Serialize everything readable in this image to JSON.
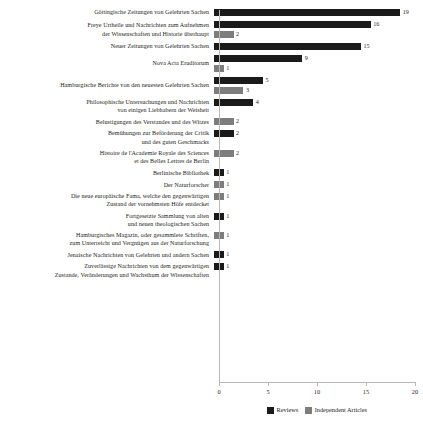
{
  "chart_data": {
    "type": "bar",
    "orientation": "horizontal",
    "title": "",
    "xlabel": "",
    "ylabel": "",
    "xlim": [
      0,
      20
    ],
    "xticks": [
      0,
      5,
      10,
      15,
      20
    ],
    "xticklabels": [
      "0",
      "5",
      "10",
      "15",
      "20"
    ],
    "grid": false,
    "legend_position": "bottom",
    "colors": {
      "reviews": "#1a1a1a",
      "independent": "#7d7d7d",
      "axis": "#b9b9b9",
      "text": "#1d1d1d",
      "background": "#ffffff"
    },
    "series": [
      {
        "name": "Reviews",
        "key": "reviews"
      },
      {
        "name": "Independent Articles",
        "key": "independent"
      }
    ],
    "categories": [
      "Göttingische Zeitungen von Gelehrten Sachen",
      "Freye Urtheile und Nachrichten zum Aufnehmen der Wissenschaften und Historie überhaupt",
      "Neuer Zeitungen von Gelehrten Sachen",
      "Nova Acta Eruditorum",
      "Hamburgische Berichte von den neuesten Gelehrten Sachen",
      "Philosophische Untersuchungen und Nachrichten von einigen Liebhabern der Weisheit",
      "Belustigungen des Verstandes und des Witzes",
      "Bemühungen zur Beförderung der Critik und des guten Geschmacks",
      "Histoire de l'Academie Royale des Sciences et des Belles Lettres de Berlin",
      "Berlinische Bibliothek",
      "Der Naturforscher",
      "Die neue europäische Fama, welche den gegenwärtigen Zustand der vornehmsten Höfe entdecket",
      "Fortgesetzte Sammlung von alten und neuen theologischen Sachen",
      "Hamburgisches Magazin, oder gesammlete Schriften, zum Unterreicht und Vergnügen aus der Naturforschung",
      "Jenaische Nachrichten von Gelehrten und andern Sachen",
      "Zuverlässige Nachrichten von dem gegenwärtigen Zustande, Veränderungen und Wachsthum der Wissenschaften"
    ],
    "rows": [
      {
        "label_lines": [
          "Göttingische Zeitungen von Gelehrten Sachen"
        ],
        "bars": [
          {
            "series": "Reviews",
            "key": "reviews",
            "value": 19,
            "value_label": "19"
          }
        ]
      },
      {
        "label_lines": [
          "Freye Urtheile und Nachrichten zum Aufnehmen",
          "der Wissenschaften und Historie überhaupt"
        ],
        "bars": [
          {
            "series": "Reviews",
            "key": "reviews",
            "value": 16,
            "value_label": "16"
          },
          {
            "series": "Independent Articles",
            "key": "independent",
            "value": 2,
            "value_label": "2"
          }
        ]
      },
      {
        "label_lines": [
          "Neuer Zeitungen von Gelehrten Sachen"
        ],
        "bars": [
          {
            "series": "Reviews",
            "key": "reviews",
            "value": 15,
            "value_label": "15"
          }
        ]
      },
      {
        "label_lines": [
          "Nova Acta Eruditorum"
        ],
        "bars": [
          {
            "series": "Reviews",
            "key": "reviews",
            "value": 9,
            "value_label": "9"
          },
          {
            "series": "Independent Articles",
            "key": "independent",
            "value": 1,
            "value_label": "1"
          }
        ]
      },
      {
        "label_lines": [
          "Hamburgische Berichte von den neuesten Gelehrten Sachen"
        ],
        "bars": [
          {
            "series": "Reviews",
            "key": "reviews",
            "value": 5,
            "value_label": "5"
          },
          {
            "series": "Independent Articles",
            "key": "independent",
            "value": 3,
            "value_label": "3"
          }
        ]
      },
      {
        "label_lines": [
          "Philosophische Untersuchungen und Nachrichten",
          "von einigen Liebhabern der Weisheit"
        ],
        "bars": [
          {
            "series": "Reviews",
            "key": "reviews",
            "value": 4,
            "value_label": "4"
          }
        ]
      },
      {
        "label_lines": [
          "Belustigungen des Verstandes und des Witzes"
        ],
        "bars": [
          {
            "series": "Independent Articles",
            "key": "independent",
            "value": 2,
            "value_label": "2"
          }
        ]
      },
      {
        "label_lines": [
          "Bemühungen zur Beförderung der Critik",
          "und des guten Geschmacks"
        ],
        "bars": [
          {
            "series": "Reviews",
            "key": "reviews",
            "value": 2,
            "value_label": "2"
          }
        ]
      },
      {
        "label_lines": [
          "Histoire de l'Academie Royale des Sciences",
          "et des Belles Lettres de Berlin"
        ],
        "bars": [
          {
            "series": "Independent Articles",
            "key": "independent",
            "value": 2,
            "value_label": "2"
          }
        ]
      },
      {
        "label_lines": [
          "Berlinische Bibliothek"
        ],
        "bars": [
          {
            "series": "Reviews",
            "key": "reviews",
            "value": 1,
            "value_label": "1"
          }
        ]
      },
      {
        "label_lines": [
          "Der Naturforscher"
        ],
        "bars": [
          {
            "series": "Independent Articles",
            "key": "independent",
            "value": 1,
            "value_label": "1"
          }
        ]
      },
      {
        "label_lines": [
          "Die neue europäische Fama, welche den gegenwärtigen",
          "Zustand der vornehmsten Höfe entdecket"
        ],
        "bars": [
          {
            "series": "Independent Articles",
            "key": "independent",
            "value": 1,
            "value_label": "1"
          }
        ]
      },
      {
        "label_lines": [
          "Fortgesetzte Sammlung von alten",
          "und neuen theologischen Sachen"
        ],
        "bars": [
          {
            "series": "Reviews",
            "key": "reviews",
            "value": 1,
            "value_label": "1"
          }
        ]
      },
      {
        "label_lines": [
          "Hamburgisches Magazin, oder gesammlete Schriften,",
          "zum Unterreicht und Vergnügen aus der Naturforschung"
        ],
        "bars": [
          {
            "series": "Independent Articles",
            "key": "independent",
            "value": 1,
            "value_label": "1"
          }
        ]
      },
      {
        "label_lines": [
          "Jenaische Nachrichten von Gelehrten und andern Sachen"
        ],
        "bars": [
          {
            "series": "Reviews",
            "key": "reviews",
            "value": 1,
            "value_label": "1"
          }
        ]
      },
      {
        "label_lines": [
          "Zuverlässige Nachrichten von dem gegenwärtigen",
          "Zustande, Veränderungen und Wachsthum der Wissenschaften"
        ],
        "bars": [
          {
            "series": "Reviews",
            "key": "reviews",
            "value": 1,
            "value_label": "1"
          }
        ]
      }
    ],
    "legend": [
      {
        "label": "Reviews",
        "key": "reviews"
      },
      {
        "label": "Independent Articles",
        "key": "independent"
      }
    ]
  }
}
